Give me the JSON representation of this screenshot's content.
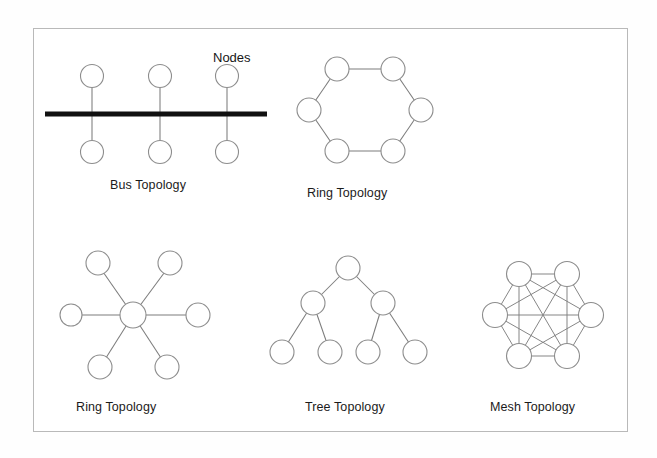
{
  "figure": {
    "background_color": "#ffffff",
    "border_color": "#b9b9b9",
    "node_stroke_color": "#8d8d8d",
    "link_color": "#7c7c7c",
    "bus_bar_color": "#111111",
    "text_color": "#1b1b1b"
  },
  "annotations": {
    "nodes_label": "Nodes"
  },
  "diagrams": [
    {
      "id": "bus",
      "caption": "Bus Topology",
      "node_count": 6,
      "description": "Six nodes, three above and three below a thick horizontal backbone bar"
    },
    {
      "id": "ring",
      "caption": "Ring Topology",
      "node_count": 6,
      "description": "Six nodes arranged in a hexagon, each connected to its two neighbours"
    },
    {
      "id": "star",
      "caption": "Ring Topology",
      "node_count": 7,
      "description": "One central node connected by spokes to six surrounding nodes"
    },
    {
      "id": "tree",
      "caption": "Tree Topology",
      "node_count": 7,
      "description": "One root node, two middle nodes, four leaf nodes"
    },
    {
      "id": "mesh",
      "caption": "Mesh Topology",
      "node_count": 6,
      "description": "Six nodes in a hexagon, every node connected to every other node"
    }
  ],
  "captions": {
    "bus": "Bus Topology",
    "ring": "Ring Topology",
    "star": "Ring Topology",
    "tree": "Tree Topology",
    "mesh": "Mesh Topology"
  }
}
